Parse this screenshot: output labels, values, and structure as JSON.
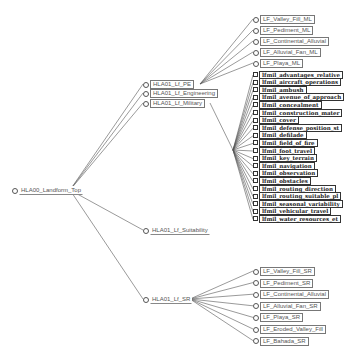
{
  "root": {
    "label": "HLA00_Landform_Top",
    "x": 12,
    "y": 190
  },
  "level1": [
    {
      "id": "pe",
      "label": "HLA01_Lf_PE",
      "x": 143,
      "y": 84
    },
    {
      "id": "eng",
      "label": "HLA01_Lf_Engineering",
      "x": 143,
      "y": 93
    },
    {
      "id": "mil",
      "label": "HLA01_Lf_Military",
      "x": 143,
      "y": 103
    },
    {
      "id": "suit",
      "label": "HLA01_Lf_Suitability",
      "x": 143,
      "y": 230
    },
    {
      "id": "sr",
      "label": "HLA01_Lf_SR",
      "x": 143,
      "y": 299
    }
  ],
  "ml_children": {
    "parent": "pe",
    "items": [
      "LF_Valley_Fill_ML",
      "LF_Pediment_ML",
      "LF_Continental_Alluvial",
      "LF_Alluvial_Fan_ML",
      "LF_Playa_ML"
    ],
    "x": 253,
    "y_start": 19,
    "y_step": 11
  },
  "military_children": {
    "parent": "mil",
    "items": [
      "lfmil_advantages_relative",
      "lfmil_aircraft_operations",
      "lfmil_ambush",
      "lfmil_avenue_of_approach",
      "lfmil_concealment",
      "lfmil_construction_mater",
      "lfmil_cover",
      "lfmil_defense_position_st",
      "lfmil_defilade",
      "lfmil_field_of_fire",
      "lfmil_foot_travel",
      "lfmil_key_terrain",
      "lfmil_navigation",
      "lfmil_observation",
      "lfmil_obstacles",
      "lfmil_routing_direction",
      "lfmil_routing_suitable_pl",
      "lfmil_seasonal_variability",
      "lfmil_vehicular_travel",
      "lfmil_water_resources_et"
    ],
    "x": 253,
    "y_start": 75,
    "y_step": 7.6
  },
  "sr_children": {
    "parent": "sr",
    "items": [
      "LF_Valley_Fill_SR",
      "LF_Pediment_SR",
      "LF_Continental_Alluvial",
      "LF_Alluvial_Fan_SR",
      "LF_Playa_SR",
      "LF_Eroded_Valley_Fill",
      "LF_Bahada_SR"
    ],
    "x": 253,
    "y_start": 271,
    "y_step": 11.6
  },
  "colors": {
    "edge": "#555555",
    "text": "#555555",
    "mil_text": "#222222",
    "background": "#ffffff"
  }
}
